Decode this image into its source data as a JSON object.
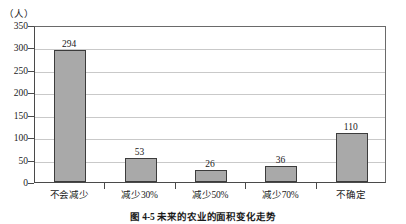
{
  "chart_data": {
    "type": "bar",
    "title": "",
    "caption": "图 4-5  未来的农业的面积变化走势",
    "unit_label": "（人）",
    "xlabel": "",
    "ylabel": "",
    "categories": [
      "不会减少",
      "减少30%",
      "减少50%",
      "减少70%",
      "不确定"
    ],
    "values": [
      294,
      53,
      26,
      36,
      110
    ],
    "ylim": [
      0,
      350
    ],
    "yticks": [
      0,
      50,
      100,
      150,
      200,
      250,
      300,
      350
    ],
    "ytick_labels": [
      "0",
      "50",
      "100",
      "150",
      "200",
      "250",
      "300",
      "350"
    ],
    "grid": true,
    "legend": false,
    "bar_fill": "#a9a9a9",
    "bar_border": "#3c3c3c",
    "grid_color": "#c9c9c9",
    "axis_color": "#4a4a4a"
  }
}
